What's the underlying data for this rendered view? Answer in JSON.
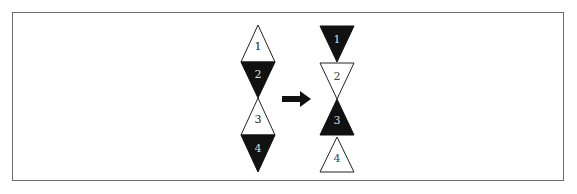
{
  "diagram": {
    "colors": {
      "dark": "#111111",
      "light": "#ffffff",
      "stroke": "#222222",
      "frame": "#6d6d6d"
    },
    "left_stack": [
      {
        "label": "1",
        "direction": "up",
        "fill": "white"
      },
      {
        "label": "2",
        "direction": "down",
        "fill": "black"
      },
      {
        "label": "3",
        "direction": "up",
        "fill": "white"
      },
      {
        "label": "4",
        "direction": "down",
        "fill": "black"
      }
    ],
    "arrow": {
      "direction": "right"
    },
    "right_stack": [
      {
        "label": "1",
        "direction": "down",
        "fill": "black"
      },
      {
        "label": "2",
        "direction": "down",
        "fill": "white"
      },
      {
        "label": "3",
        "direction": "up",
        "fill": "black"
      },
      {
        "label": "4",
        "direction": "up",
        "fill": "white"
      }
    ]
  }
}
